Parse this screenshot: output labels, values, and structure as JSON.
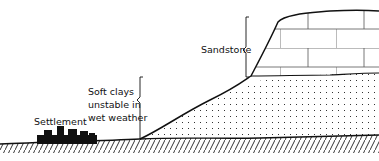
{
  "diagram": {
    "type": "geological cross-section",
    "labels": {
      "sandstone": "Sandstone",
      "clay_line1": "Soft clays",
      "clay_line2": "unstable in",
      "clay_line3": "wet weather",
      "settlement": "Settlement"
    },
    "colors": {
      "ink": "#111111",
      "background": "#ffffff"
    }
  }
}
